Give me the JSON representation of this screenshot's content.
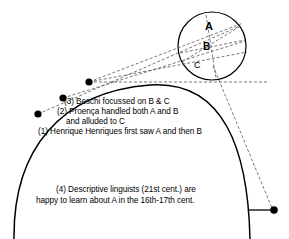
{
  "figure": {
    "title_text": "",
    "background_color": "#ffffff",
    "stroke_color": "#000000",
    "dash_color": "#555555"
  },
  "inset_circle": {
    "label_a": "A",
    "label_b": "B",
    "label_c": "C",
    "center_x": 212,
    "center_y": 46,
    "radius": 34
  },
  "annotations": {
    "line1": "(3) Beschi focussed on B & C",
    "line2": "(2) Proença handled both A and B",
    "line3": "and alluded to C",
    "line4": "(1) Henrique Henriques first saw A and then B",
    "bottom_line1": "(4) Descriptive linguists (21st cent.) are",
    "bottom_line2": "happy to learn about A in the 16th-17th cent."
  },
  "markers": {
    "observer_1": {
      "x": 38,
      "y": 114
    },
    "observer_2": {
      "x": 63,
      "y": 98
    },
    "observer_3": {
      "x": 89,
      "y": 82
    },
    "observer_4": {
      "x": 274,
      "y": 210
    }
  }
}
